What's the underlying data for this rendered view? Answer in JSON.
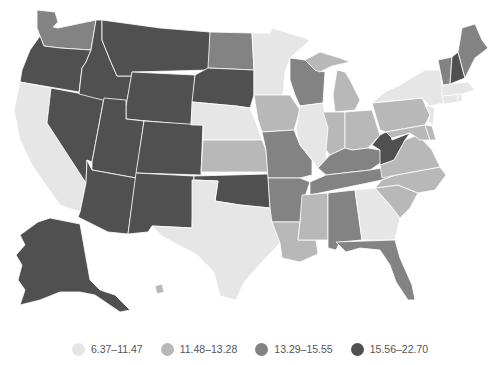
{
  "legend": {
    "classes": [
      {
        "label": "6.37–11.47",
        "color": "#e6e6e6"
      },
      {
        "label": "11.48–13.28",
        "color": "#b8b8b8"
      },
      {
        "label": "13.29–15.55",
        "color": "#838383"
      },
      {
        "label": "15.56–22.70",
        "color": "#505050"
      }
    ]
  },
  "map": {
    "type": "choropleth",
    "region": "United States",
    "states": {
      "WA": 2,
      "OR": 3,
      "CA": 0,
      "NV": 3,
      "ID": 3,
      "MT": 3,
      "WY": 3,
      "UT": 3,
      "AZ": 3,
      "CO": 3,
      "NM": 3,
      "ND": 2,
      "SD": 3,
      "NE": 0,
      "KS": 1,
      "OK": 3,
      "TX": 0,
      "MN": 0,
      "IA": 1,
      "MO": 2,
      "AR": 2,
      "LA": 1,
      "WI": 2,
      "IL": 0,
      "MI": 1,
      "IN": 1,
      "OH": 1,
      "KY": 2,
      "TN": 2,
      "MS": 1,
      "AL": 2,
      "GA": 0,
      "FL": 2,
      "SC": 1,
      "NC": 1,
      "VA": 1,
      "WV": 3,
      "PA": 1,
      "NY": 0,
      "VT": 2,
      "NH": 3,
      "ME": 2,
      "MA": 0,
      "CT": 0,
      "RI": 0,
      "NJ": 0,
      "DE": 1,
      "MD": 1,
      "AK": 3,
      "HI": 1
    }
  }
}
